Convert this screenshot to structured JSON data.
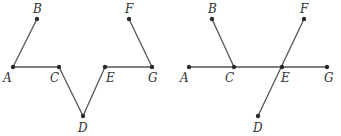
{
  "figures": [
    {
      "id": "left",
      "points": {
        "A": {
          "x": 13,
          "y": 67,
          "label": "A",
          "lx": 3,
          "ly": 82
        },
        "B": {
          "x": 37,
          "y": 19,
          "label": "B",
          "lx": 33,
          "ly": 13
        },
        "C": {
          "x": 59,
          "y": 67,
          "label": "C",
          "lx": 50,
          "ly": 82
        },
        "D": {
          "x": 83,
          "y": 116,
          "label": "D",
          "lx": 78,
          "ly": 132
        },
        "E": {
          "x": 105,
          "y": 67,
          "label": "E",
          "lx": 106,
          "ly": 82
        },
        "F": {
          "x": 129,
          "y": 19,
          "label": "F",
          "lx": 125,
          "ly": 13
        },
        "G": {
          "x": 152,
          "y": 67,
          "label": "G",
          "lx": 148,
          "ly": 82
        }
      },
      "segments": [
        [
          "A",
          "B"
        ],
        [
          "A",
          "C"
        ],
        [
          "C",
          "D"
        ],
        [
          "D",
          "E"
        ],
        [
          "E",
          "G"
        ],
        [
          "G",
          "F"
        ]
      ]
    },
    {
      "id": "right",
      "points": {
        "A": {
          "x": 189,
          "y": 67,
          "label": "A",
          "lx": 180,
          "ly": 82
        },
        "B": {
          "x": 212,
          "y": 19,
          "label": "B",
          "lx": 208,
          "ly": 13
        },
        "C": {
          "x": 234,
          "y": 67,
          "label": "C",
          "lx": 225,
          "ly": 82
        },
        "D": {
          "x": 258,
          "y": 116,
          "label": "D",
          "lx": 253,
          "ly": 132
        },
        "E": {
          "x": 282,
          "y": 67,
          "label": "E",
          "lx": 281,
          "ly": 82
        },
        "F": {
          "x": 304,
          "y": 19,
          "label": "F",
          "lx": 300,
          "ly": 13
        },
        "G": {
          "x": 327,
          "y": 67,
          "label": "G",
          "lx": 324,
          "ly": 82
        }
      },
      "segments": [
        [
          "A",
          "G"
        ],
        [
          "B",
          "C"
        ],
        [
          "D",
          "F"
        ]
      ]
    }
  ],
  "colors": {
    "line": "#555555",
    "point": "#2b2b2b",
    "label": "#333333"
  }
}
